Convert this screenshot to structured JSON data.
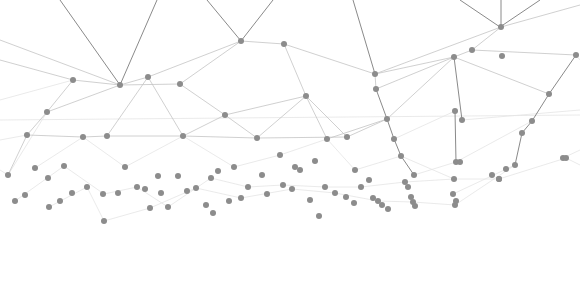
{
  "graphic": {
    "type": "network-plexus-illustration",
    "background": "#ffffff",
    "node_color": "#8c8c8c",
    "edge_colors": {
      "dark": "#8a8a8a",
      "mid": "#c4c4c4",
      "light": "#e4e4e4"
    },
    "node_radius": 3,
    "nodes": [
      [
        120,
        85
      ],
      [
        148,
        77
      ],
      [
        180,
        84
      ],
      [
        241,
        41
      ],
      [
        284,
        44
      ],
      [
        73,
        80
      ],
      [
        47,
        112
      ],
      [
        27,
        135
      ],
      [
        83,
        137
      ],
      [
        107,
        136
      ],
      [
        183,
        136
      ],
      [
        225,
        115
      ],
      [
        257,
        138
      ],
      [
        306,
        96
      ],
      [
        327,
        139
      ],
      [
        347,
        137
      ],
      [
        375,
        74
      ],
      [
        376,
        89
      ],
      [
        387,
        119
      ],
      [
        394,
        139
      ],
      [
        401,
        156
      ],
      [
        414,
        175
      ],
      [
        454,
        57
      ],
      [
        472,
        50
      ],
      [
        492,
        175
      ],
      [
        501,
        27
      ],
      [
        532,
        121
      ],
      [
        549,
        94
      ],
      [
        576,
        55
      ],
      [
        563,
        158
      ],
      [
        502,
        56
      ],
      [
        522,
        133
      ],
      [
        455,
        111
      ],
      [
        462,
        120
      ],
      [
        456,
        162
      ],
      [
        460,
        162
      ],
      [
        454,
        179
      ],
      [
        453,
        194
      ],
      [
        456,
        201
      ],
      [
        515,
        165
      ],
      [
        506,
        169
      ],
      [
        499,
        179
      ],
      [
        499,
        179
      ],
      [
        566,
        158
      ],
      [
        8,
        175
      ],
      [
        35,
        168
      ],
      [
        48,
        178
      ],
      [
        64,
        166
      ],
      [
        15,
        201
      ],
      [
        25,
        195
      ],
      [
        49,
        207
      ],
      [
        60,
        201
      ],
      [
        72,
        193
      ],
      [
        87,
        187
      ],
      [
        104,
        221
      ],
      [
        103,
        194
      ],
      [
        118,
        193
      ],
      [
        125,
        167
      ],
      [
        137,
        187
      ],
      [
        145,
        189
      ],
      [
        158,
        176
      ],
      [
        161,
        193
      ],
      [
        150,
        208
      ],
      [
        168,
        207
      ],
      [
        178,
        176
      ],
      [
        187,
        191
      ],
      [
        196,
        188
      ],
      [
        211,
        178
      ],
      [
        218,
        171
      ],
      [
        206,
        205
      ],
      [
        213,
        213
      ],
      [
        229,
        201
      ],
      [
        241,
        198
      ],
      [
        234,
        167
      ],
      [
        248,
        187
      ],
      [
        262,
        175
      ],
      [
        267,
        194
      ],
      [
        280,
        155
      ],
      [
        283,
        185
      ],
      [
        292,
        189
      ],
      [
        295,
        167
      ],
      [
        300,
        170
      ],
      [
        315,
        161
      ],
      [
        325,
        187
      ],
      [
        335,
        193
      ],
      [
        346,
        197
      ],
      [
        319,
        216
      ],
      [
        310,
        200
      ],
      [
        354,
        203
      ],
      [
        361,
        187
      ],
      [
        369,
        180
      ],
      [
        373,
        198
      ],
      [
        378,
        201
      ],
      [
        382,
        205
      ],
      [
        405,
        182
      ],
      [
        408,
        187
      ],
      [
        411,
        197
      ],
      [
        413,
        202
      ],
      [
        415,
        206
      ],
      [
        355,
        170
      ],
      [
        388,
        209
      ],
      [
        455,
        205
      ]
    ],
    "edges_dark": [
      [
        60,
        0,
        120,
        85
      ],
      [
        157,
        0,
        120,
        85
      ],
      [
        207,
        0,
        241,
        41
      ],
      [
        273,
        0,
        241,
        41
      ],
      [
        353,
        0,
        375,
        74
      ],
      [
        500,
        27,
        460,
        0
      ],
      [
        500,
        27,
        540,
        0
      ],
      [
        501,
        27,
        501,
        0
      ],
      [
        376,
        89,
        387,
        119
      ],
      [
        387,
        119,
        394,
        139
      ],
      [
        394,
        139,
        401,
        156
      ],
      [
        401,
        156,
        414,
        175
      ],
      [
        454,
        57,
        462,
        120
      ],
      [
        455,
        111,
        456,
        162
      ],
      [
        532,
        121,
        549,
        94
      ],
      [
        549,
        94,
        576,
        55
      ],
      [
        522,
        133,
        532,
        121
      ],
      [
        515,
        165,
        522,
        133
      ]
    ],
    "edges_mid": [
      [
        0,
        40,
        120,
        85
      ],
      [
        0,
        60,
        73,
        80
      ],
      [
        120,
        85,
        148,
        77
      ],
      [
        120,
        85,
        180,
        84
      ],
      [
        148,
        77,
        241,
        41
      ],
      [
        180,
        84,
        241,
        41
      ],
      [
        241,
        41,
        284,
        44
      ],
      [
        284,
        44,
        375,
        74
      ],
      [
        375,
        74,
        501,
        27
      ],
      [
        375,
        74,
        454,
        57
      ],
      [
        375,
        74,
        376,
        89
      ],
      [
        454,
        57,
        472,
        50
      ],
      [
        472,
        50,
        501,
        27
      ],
      [
        501,
        27,
        580,
        5
      ],
      [
        472,
        50,
        576,
        55
      ],
      [
        454,
        57,
        549,
        94
      ],
      [
        73,
        80,
        120,
        85
      ],
      [
        73,
        80,
        47,
        112
      ],
      [
        47,
        112,
        27,
        135
      ],
      [
        27,
        135,
        8,
        175
      ],
      [
        120,
        85,
        47,
        112
      ],
      [
        148,
        77,
        107,
        136
      ],
      [
        148,
        77,
        183,
        136
      ],
      [
        180,
        84,
        225,
        115
      ],
      [
        225,
        115,
        257,
        138
      ],
      [
        284,
        44,
        306,
        96
      ],
      [
        306,
        96,
        327,
        139
      ],
      [
        306,
        96,
        347,
        137
      ],
      [
        376,
        89,
        454,
        57
      ],
      [
        387,
        119,
        454,
        57
      ],
      [
        27,
        135,
        83,
        137
      ],
      [
        83,
        137,
        107,
        136
      ],
      [
        107,
        136,
        183,
        136
      ],
      [
        183,
        136,
        257,
        138
      ],
      [
        257,
        138,
        347,
        137
      ],
      [
        347,
        137,
        387,
        119
      ],
      [
        257,
        138,
        306,
        96
      ],
      [
        183,
        136,
        225,
        115
      ],
      [
        225,
        115,
        306,
        96
      ],
      [
        327,
        139,
        387,
        119
      ]
    ],
    "edges_light": [
      [
        0,
        120,
        580,
        115
      ],
      [
        0,
        100,
        73,
        80
      ],
      [
        8,
        175,
        47,
        112
      ],
      [
        35,
        168,
        83,
        137
      ],
      [
        83,
        137,
        125,
        167
      ],
      [
        125,
        167,
        183,
        136
      ],
      [
        183,
        136,
        234,
        167
      ],
      [
        234,
        167,
        280,
        155
      ],
      [
        280,
        155,
        327,
        139
      ],
      [
        327,
        139,
        355,
        170
      ],
      [
        355,
        170,
        401,
        156
      ],
      [
        401,
        156,
        454,
        179
      ],
      [
        454,
        179,
        499,
        179
      ],
      [
        499,
        179,
        566,
        158
      ],
      [
        566,
        158,
        580,
        165
      ],
      [
        456,
        162,
        532,
        121
      ],
      [
        462,
        120,
        580,
        110
      ],
      [
        394,
        139,
        455,
        111
      ],
      [
        414,
        175,
        456,
        162
      ],
      [
        453,
        194,
        515,
        165
      ],
      [
        64,
        166,
        104,
        194
      ],
      [
        104,
        194,
        137,
        187
      ],
      [
        137,
        187,
        168,
        207
      ],
      [
        168,
        207,
        211,
        178
      ],
      [
        211,
        178,
        248,
        187
      ],
      [
        248,
        187,
        283,
        185
      ],
      [
        283,
        185,
        325,
        187
      ],
      [
        325,
        187,
        361,
        187
      ],
      [
        361,
        187,
        405,
        182
      ],
      [
        405,
        182,
        454,
        179
      ],
      [
        15,
        201,
        64,
        166
      ],
      [
        49,
        207,
        87,
        187
      ],
      [
        87,
        187,
        104,
        221
      ],
      [
        104,
        221,
        150,
        208
      ],
      [
        150,
        208,
        196,
        188
      ],
      [
        196,
        188,
        241,
        198
      ],
      [
        241,
        198,
        292,
        189
      ],
      [
        292,
        189,
        335,
        193
      ],
      [
        335,
        193,
        378,
        201
      ],
      [
        378,
        201,
        413,
        202
      ],
      [
        413,
        202,
        455,
        205
      ],
      [
        455,
        205,
        515,
        165
      ],
      [
        0,
        140,
        27,
        135
      ],
      [
        0,
        170,
        8,
        175
      ],
      [
        576,
        55,
        580,
        60
      ],
      [
        563,
        158,
        580,
        150
      ]
    ]
  }
}
